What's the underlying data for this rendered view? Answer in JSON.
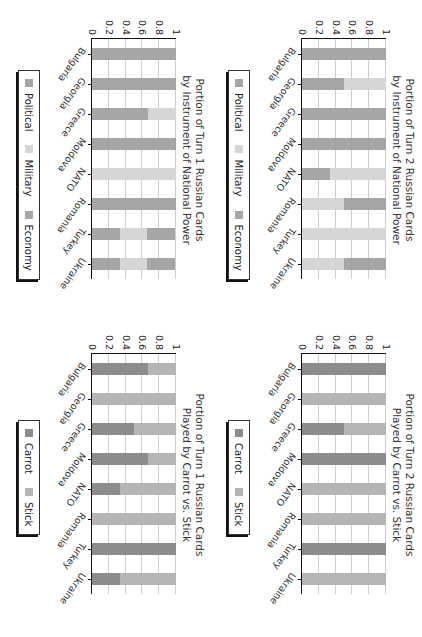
{
  "colors": {
    "Political": "#a6a6a6",
    "Military": "#d6d6d6",
    "Economy": "#a6a6a6",
    "Carrot": "#8c8c8c",
    "Stick": "#b5b5b5"
  },
  "chart_data": [
    {
      "id": "turn1-instrument",
      "type": "bar",
      "stacked": true,
      "title": "Portion of Turn 1 Russian Cards by Instrument of National Power",
      "title_lines": [
        "Portion of Turn 1 Russian Cards",
        "by Instrument of National Power"
      ],
      "categories": [
        "Bulgaria",
        "Georgia",
        "Greece",
        "Moldova",
        "NATO",
        "Romania",
        "Turkey",
        "Ukraine"
      ],
      "series": [
        {
          "name": "Political",
          "values": [
            1,
            1,
            0.67,
            1,
            0,
            1,
            0.33,
            0.33
          ]
        },
        {
          "name": "Military",
          "values": [
            0,
            0,
            0.33,
            0,
            1,
            0,
            0.33,
            0.33
          ]
        },
        {
          "name": "Economy",
          "values": [
            0,
            0,
            0,
            0,
            0,
            0,
            0.33,
            0.33
          ]
        }
      ],
      "yticks": [
        "0",
        "0.2",
        "0.4",
        "0.6",
        "0.8",
        "1"
      ],
      "ylim": [
        0,
        1
      ],
      "xlabel": "",
      "ylabel": "",
      "grid": true,
      "legend": [
        "Political",
        "Military",
        "Economy"
      ],
      "legend_position": "bottom"
    },
    {
      "id": "turn2-instrument",
      "type": "bar",
      "stacked": true,
      "title": "Portion of Turn 2 Russian Cards by Instrument of National Power",
      "title_lines": [
        "Portion of Turn 2 Russian Cards",
        "by Instrument of National Power"
      ],
      "categories": [
        "Bulgaria",
        "Georgia",
        "Greece",
        "Moldova",
        "NATO",
        "Romania",
        "Turkey",
        "Ukraine"
      ],
      "series": [
        {
          "name": "Political",
          "values": [
            1,
            0.5,
            1,
            1,
            0.33,
            0,
            0,
            0
          ]
        },
        {
          "name": "Military",
          "values": [
            0,
            0.5,
            0,
            0,
            0.67,
            0.5,
            1,
            0.5
          ]
        },
        {
          "name": "Economy",
          "values": [
            0,
            0,
            0,
            0,
            0,
            0.5,
            0,
            0.5
          ]
        }
      ],
      "yticks": [
        "0",
        "0.2",
        "0.4",
        "0.6",
        "0.8",
        "1"
      ],
      "ylim": [
        0,
        1
      ],
      "xlabel": "",
      "ylabel": "",
      "grid": true,
      "legend": [
        "Political",
        "Military",
        "Economy"
      ],
      "legend_position": "bottom"
    },
    {
      "id": "turn1-carrot-stick",
      "type": "bar",
      "stacked": true,
      "title": "Portion of Turn 1 Russian Cards Played by Carrot vs. Stick",
      "title_lines": [
        "Portion of Turn 1 Russian Cards",
        "Played by Carrot vs. Stick"
      ],
      "categories": [
        "Bulgaria",
        "Georgia",
        "Greece",
        "Moldova",
        "NATO",
        "Romania",
        "Turkey",
        "Ukraine"
      ],
      "series": [
        {
          "name": "Carrot",
          "values": [
            0.67,
            0,
            0.5,
            0.67,
            0.33,
            0,
            1,
            0.33
          ]
        },
        {
          "name": "Stick",
          "values": [
            0.33,
            1,
            0.5,
            0.33,
            0.67,
            1,
            0,
            0.67
          ]
        }
      ],
      "yticks": [
        "0",
        "0.2",
        "0.4",
        "0.6",
        "0.8",
        "1"
      ],
      "ylim": [
        0,
        1
      ],
      "xlabel": "",
      "ylabel": "",
      "grid": true,
      "legend": [
        "Carrot",
        "Stick"
      ],
      "legend_position": "bottom"
    },
    {
      "id": "turn2-carrot-stick",
      "type": "bar",
      "stacked": true,
      "title": "Portion of Turn 2 Russian Cards Played by Carrot vs. Stick",
      "title_lines": [
        "Portion of Turn 2 Russian Cards",
        "Played by Carrot vs. Stick"
      ],
      "categories": [
        "Bulgaria",
        "Georgia",
        "Greece",
        "Moldova",
        "NATO",
        "Romania",
        "Turkey",
        "Ukraine"
      ],
      "series": [
        {
          "name": "Carrot",
          "values": [
            1,
            0,
            0.5,
            1,
            0,
            0,
            1,
            0
          ]
        },
        {
          "name": "Stick",
          "values": [
            0,
            1,
            0.5,
            0,
            1,
            1,
            0,
            1
          ]
        }
      ],
      "yticks": [
        "0",
        "0.2",
        "0.4",
        "0.6",
        "0.8",
        "1"
      ],
      "ylim": [
        0,
        1
      ],
      "xlabel": "",
      "ylabel": "",
      "grid": true,
      "legend": [
        "Carrot",
        "Stick"
      ],
      "legend_position": "bottom"
    }
  ]
}
